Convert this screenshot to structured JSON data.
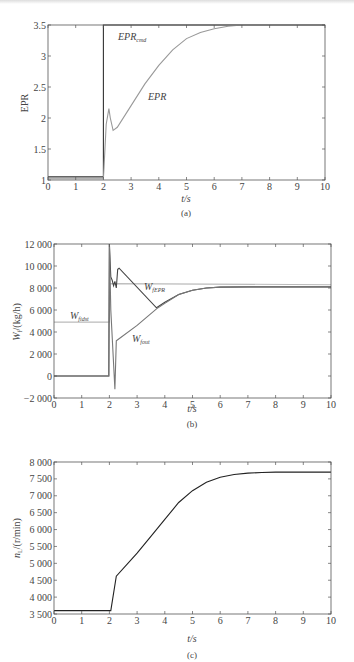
{
  "chart_data": [
    {
      "type": "line",
      "panel": "(a)",
      "caption": "(a)",
      "xlabel": "t/s",
      "ylabel": "EPR",
      "xlim": [
        0,
        10
      ],
      "ylim": [
        1,
        3.5
      ],
      "xticks": [
        0,
        1,
        2,
        3,
        4,
        5,
        6,
        7,
        8,
        9,
        10
      ],
      "yticks": [
        1,
        1.5,
        2,
        2.5,
        3,
        3.5
      ],
      "ytick_labels": [
        "1",
        "1.5",
        "2",
        "2.5",
        "3",
        "3.5"
      ],
      "grid": false,
      "series": [
        {
          "name": "EPR_cmd",
          "label": "EPR",
          "sub": "cmd",
          "color": "#333333",
          "x": [
            0,
            2,
            2,
            10
          ],
          "y": [
            1.05,
            1.05,
            3.5,
            3.5
          ]
        },
        {
          "name": "EPR",
          "label": "EPR",
          "sub": "",
          "color": "#999999",
          "x": [
            0,
            2,
            2.02,
            2.1,
            2.2,
            2.25,
            2.35,
            2.5,
            3,
            3.5,
            4,
            4.5,
            5,
            5.5,
            6,
            6.5,
            7,
            7.5,
            8,
            10
          ],
          "y": [
            1.02,
            1.02,
            1.2,
            1.9,
            2.15,
            2.0,
            1.8,
            1.85,
            2.2,
            2.55,
            2.85,
            3.1,
            3.28,
            3.38,
            3.44,
            3.48,
            3.5,
            3.5,
            3.5,
            3.5
          ]
        }
      ],
      "annotations": [
        {
          "text": "EPR",
          "sub": "cmd",
          "x": 2.5,
          "y": 3.38
        },
        {
          "text": "EPR",
          "sub": "",
          "x": 3.6,
          "y": 2.42
        }
      ]
    },
    {
      "type": "line",
      "panel": "(b)",
      "caption": "(b)",
      "xlabel": "t/s",
      "ylabel": "W_f/(kg/h)",
      "xlim": [
        0,
        10
      ],
      "ylim": [
        -2000,
        12000
      ],
      "xticks": [
        0,
        1,
        2,
        3,
        4,
        5,
        6,
        7,
        8,
        9,
        10
      ],
      "yticks": [
        -2000,
        0,
        2000,
        4000,
        6000,
        8000,
        10000,
        12000
      ],
      "ytick_labels": [
        "−2 000",
        "0",
        "2 000",
        "4 000",
        "6 000",
        "8 000",
        "10 000",
        "12 000"
      ],
      "grid": false,
      "series": [
        {
          "name": "W_fidst",
          "sub": "fidst",
          "color": "#bbbbbb",
          "x": [
            0,
            2,
            2.02,
            10
          ],
          "y": [
            4900,
            4900,
            8400,
            8300
          ]
        },
        {
          "name": "W_fEPR",
          "sub": "fEPR",
          "color": "#444444",
          "x": [
            0,
            1.98,
            2.0,
            2.05,
            2.1,
            2.15,
            2.2,
            2.25,
            2.3,
            2.35,
            3.7,
            4.0,
            4.5,
            5.0,
            5.5,
            6.0,
            7,
            10
          ],
          "y": [
            0,
            0,
            12000,
            9000,
            8700,
            8200,
            8600,
            8000,
            9700,
            9800,
            6200,
            6700,
            7400,
            7800,
            8000,
            8080,
            8100,
            8100
          ]
        },
        {
          "name": "W_fout",
          "sub": "fout",
          "color": "#777777",
          "x": [
            0,
            1.98,
            2.0,
            2.05,
            2.2,
            2.25,
            2.3,
            3.0,
            3.7,
            4.0,
            4.5,
            5.0,
            5.5,
            6.0,
            7,
            10
          ],
          "y": [
            0,
            0,
            12000,
            6000,
            -1200,
            3200,
            3300,
            4600,
            6100,
            6600,
            7400,
            7800,
            8000,
            8080,
            8100,
            8100
          ]
        }
      ],
      "annotations": [
        {
          "text": "W",
          "sub": "fEPR",
          "x": 3.2,
          "y": 8500
        },
        {
          "text": "W",
          "sub": "fidst",
          "x": 0.6,
          "y": 5400
        },
        {
          "text": "W",
          "sub": "fout",
          "x": 2.9,
          "y": 3600
        }
      ]
    },
    {
      "type": "line",
      "panel": "(c)",
      "caption": "(c)",
      "xlabel": "t/s",
      "ylabel": "n_L/(r/min)",
      "xlim": [
        0,
        10
      ],
      "ylim": [
        3500,
        8000
      ],
      "xticks": [
        0,
        1,
        2,
        3,
        4,
        5,
        6,
        7,
        8,
        9,
        10
      ],
      "yticks": [
        3500,
        4000,
        4500,
        5000,
        5500,
        6000,
        6500,
        7000,
        7500,
        8000
      ],
      "ytick_labels": [
        "3 500",
        "4 000",
        "4 500",
        "5 000",
        "5 500",
        "6 000",
        "6 500",
        "7 000",
        "7 500",
        "8 000"
      ],
      "grid": false,
      "series": [
        {
          "name": "n_L",
          "color": "#222222",
          "x": [
            0,
            2.05,
            2.25,
            3,
            3.5,
            4,
            4.5,
            5,
            5.5,
            6,
            6.5,
            7,
            7.5,
            8,
            10
          ],
          "y": [
            3600,
            3600,
            4620,
            5300,
            5800,
            6300,
            6800,
            7150,
            7400,
            7550,
            7630,
            7670,
            7690,
            7700,
            7700
          ]
        }
      ]
    }
  ],
  "panels": {
    "a": {
      "caption": "(a)",
      "xlabel": "t/s",
      "ylabel": "EPR",
      "label_cmd": "EPR",
      "label_cmd_sub": "cmd",
      "label_epr": "EPR"
    },
    "b": {
      "caption": "(b)",
      "xlabel": "t/s",
      "ylabel_main": "W",
      "ylabel_sub": "f",
      "ylabel_rest": "/(kg/h)",
      "label_fepr": "W",
      "label_fepr_sub": "fEPR",
      "label_fidst": "W",
      "label_fidst_sub": "fidst",
      "label_fout": "W",
      "label_fout_sub": "fout"
    },
    "c": {
      "caption": "(c)",
      "xlabel": "t/s",
      "ylabel_main": "n",
      "ylabel_sub": "L",
      "ylabel_rest": "/(r/min)"
    }
  }
}
